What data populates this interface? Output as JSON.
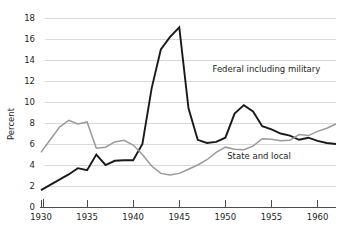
{
  "chart_data": {
    "type": "line",
    "title": "",
    "xlabel": "",
    "ylabel": "Percent",
    "xlim": [
      1930,
      1962
    ],
    "ylim": [
      0,
      18
    ],
    "ytick_values": [
      0,
      2,
      4,
      6,
      8,
      10,
      12,
      14,
      16,
      18
    ],
    "ytick_labels": [
      "0",
      "2",
      "4",
      "6",
      "8",
      "10",
      "12",
      "14",
      "16",
      "18"
    ],
    "xtick_values": [
      1930,
      1935,
      1940,
      1945,
      1950,
      1955,
      1960
    ],
    "xtick_labels": [
      "1930",
      "1935",
      "1940",
      "1945",
      "1950",
      "1955",
      "1960"
    ],
    "grid": "horizontal",
    "legend_position": "inline-annotation",
    "x": [
      1930,
      1931,
      1932,
      1933,
      1934,
      1935,
      1936,
      1937,
      1938,
      1939,
      1940,
      1941,
      1942,
      1943,
      1944,
      1945,
      1946,
      1947,
      1948,
      1949,
      1950,
      1951,
      1952,
      1953,
      1954,
      1955,
      1956,
      1957,
      1958,
      1959,
      1960,
      1961,
      1962
    ],
    "series": [
      {
        "name": "Federal including military",
        "color": "#1a1a1a",
        "label_x": 1948.6,
        "label_y": 12.9,
        "values": [
          1.6,
          2.1,
          2.6,
          3.1,
          3.7,
          3.5,
          5.0,
          4.0,
          4.4,
          4.45,
          4.45,
          6.0,
          11.3,
          15.0,
          16.2,
          17.1,
          9.4,
          6.4,
          6.1,
          6.2,
          6.6,
          8.9,
          9.7,
          9.1,
          7.7,
          7.4,
          7.0,
          6.8,
          6.4,
          6.6,
          6.3,
          6.1,
          6.0
        ]
      },
      {
        "name": "State and local",
        "color": "#9a9a9a",
        "label_x": 1950.2,
        "label_y": 4.6,
        "values": [
          5.2,
          6.4,
          7.6,
          8.25,
          7.9,
          8.1,
          5.6,
          5.7,
          6.2,
          6.35,
          5.9,
          5.0,
          3.9,
          3.2,
          3.05,
          3.2,
          3.6,
          4.0,
          4.5,
          5.2,
          5.7,
          5.5,
          5.45,
          5.8,
          6.5,
          6.45,
          6.3,
          6.35,
          6.9,
          6.8,
          7.2,
          7.5,
          7.9
        ]
      }
    ]
  }
}
